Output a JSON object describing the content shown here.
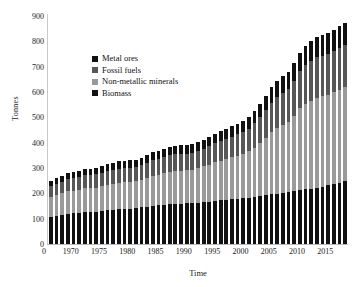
{
  "chart_data": {
    "type": "bar",
    "stacked": true,
    "title": "",
    "xlabel": "Time",
    "ylabel": "Tonnes",
    "ylim": [
      0,
      900
    ],
    "ytick_step": 100,
    "yticks": [
      0,
      100,
      200,
      300,
      400,
      500,
      600,
      700,
      800,
      900
    ],
    "xticks": [
      1970,
      1975,
      1980,
      1985,
      1990,
      1995,
      2000,
      2005,
      2010,
      2015
    ],
    "xlim": [
      1966.5,
      2019.5
    ],
    "grid": false,
    "legend_position": "upper-left-inside",
    "categories": [
      1967,
      1968,
      1969,
      1970,
      1971,
      1972,
      1973,
      1974,
      1975,
      1976,
      1977,
      1978,
      1979,
      1980,
      1981,
      1982,
      1983,
      1984,
      1985,
      1986,
      1987,
      1988,
      1989,
      1990,
      1991,
      1992,
      1993,
      1994,
      1995,
      1996,
      1997,
      1998,
      1999,
      2000,
      2001,
      2002,
      2003,
      2004,
      2005,
      2006,
      2007,
      2008,
      2009,
      2010,
      2011,
      2012,
      2013,
      2014,
      2015,
      2016,
      2017,
      2018,
      2019
    ],
    "series": [
      {
        "name": "Biomass",
        "color": "#111111",
        "values": [
          108,
          112,
          115,
          119,
          121,
          123,
          126,
          126,
          128,
          131,
          133,
          135,
          137,
          139,
          140,
          142,
          145,
          148,
          151,
          153,
          155,
          157,
          158,
          159,
          160,
          161,
          163,
          165,
          167,
          170,
          172,
          174,
          176,
          178,
          180,
          182,
          185,
          188,
          192,
          196,
          199,
          202,
          205,
          209,
          213,
          216,
          216,
          221,
          226,
          231,
          236,
          241,
          249
        ]
      },
      {
        "name": "Non-metallic minerals",
        "color": "#9a9a9a",
        "values": [
          79,
          82,
          86,
          89,
          90,
          91,
          94,
          94,
          95,
          98,
          100,
          102,
          104,
          105,
          105,
          106,
          109,
          113,
          118,
          121,
          124,
          128,
          130,
          131,
          131,
          132,
          136,
          141,
          146,
          152,
          157,
          161,
          166,
          171,
          177,
          184,
          196,
          212,
          228,
          245,
          258,
          268,
          276,
          296,
          322,
          338,
          349,
          357,
          357,
          358,
          363,
          368,
          371
        ]
      },
      {
        "name": "Fossil fuels",
        "color": "#575757",
        "values": [
          41,
          43,
          45,
          47,
          48,
          49,
          51,
          51,
          52,
          53,
          54,
          55,
          56,
          56,
          56,
          56,
          57,
          59,
          61,
          62,
          63,
          65,
          66,
          66,
          66,
          66,
          68,
          70,
          72,
          75,
          77,
          79,
          81,
          84,
          87,
          90,
          96,
          102,
          110,
          117,
          124,
          128,
          131,
          138,
          147,
          152,
          156,
          159,
          159,
          160,
          162,
          164,
          165
        ]
      },
      {
        "name": "Metal ores",
        "color": "#111111",
        "values": [
          22,
          23,
          24,
          25,
          25,
          26,
          27,
          27,
          27,
          28,
          28,
          29,
          29,
          29,
          29,
          29,
          30,
          31,
          32,
          33,
          33,
          34,
          34,
          34,
          34,
          35,
          35,
          36,
          37,
          38,
          39,
          40,
          41,
          42,
          43,
          45,
          48,
          52,
          56,
          60,
          63,
          65,
          67,
          70,
          74,
          77,
          79,
          81,
          82,
          83,
          85,
          86,
          87
        ]
      }
    ],
    "totals": [
      250,
      260,
      270,
      280,
      284,
      289,
      298,
      298,
      302,
      310,
      315,
      321,
      326,
      329,
      330,
      333,
      341,
      351,
      362,
      369,
      375,
      384,
      388,
      390,
      391,
      394,
      402,
      412,
      422,
      435,
      445,
      454,
      464,
      475,
      487,
      501,
      525,
      554,
      586,
      618,
      644,
      663,
      679,
      713,
      756,
      783,
      800,
      818,
      824,
      832,
      846,
      859,
      872
    ]
  },
  "legend": {
    "entries": [
      {
        "label": "Metal ores",
        "color": "#111111"
      },
      {
        "label": "Fossil fuels",
        "color": "#575757"
      },
      {
        "label": "Non-metallic minerals",
        "color": "#9a9a9a"
      },
      {
        "label": "Biomass",
        "color": "#111111"
      }
    ]
  }
}
